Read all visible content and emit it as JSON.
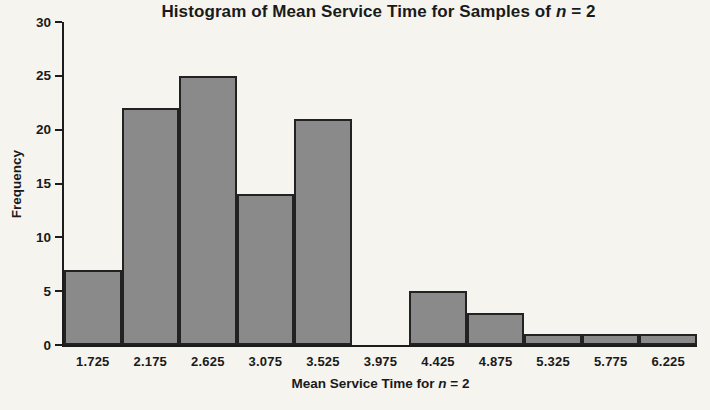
{
  "title_parts": {
    "prefix": "Histogram of Mean Service Time for Samples of ",
    "italic": "n",
    "suffix": " = 2"
  },
  "xlabel_parts": {
    "prefix": "Mean Service Time for ",
    "italic": "n",
    "suffix": " = 2"
  },
  "chart_data": {
    "type": "bar",
    "title": "Histogram of Mean Service Time for Samples of n = 2",
    "xlabel": "Mean Service Time for n = 2",
    "ylabel": "Frequency",
    "categories": [
      "1.725",
      "2.175",
      "2.625",
      "3.075",
      "3.525",
      "3.975",
      "4.425",
      "4.875",
      "5.325",
      "5.775",
      "6.225"
    ],
    "values": [
      7,
      22,
      25,
      14,
      21,
      0,
      5,
      3,
      1,
      1,
      1
    ],
    "ylim": [
      0,
      30
    ],
    "yticks": [
      0,
      5,
      10,
      15,
      20,
      25,
      30
    ],
    "grid": false,
    "legend": null,
    "bar_fill": "#8a8a8a",
    "bar_border": "#222222"
  },
  "colors": {
    "background": "#f5f4ef",
    "axis": "#1c1c1c",
    "text": "#1a1a1a"
  }
}
